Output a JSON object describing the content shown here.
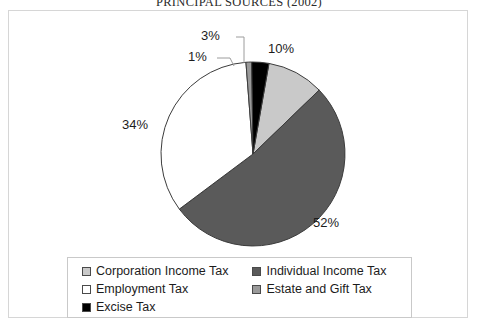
{
  "chart_data": {
    "type": "pie",
    "title": "PRINCIPAL SOURCES (2002)",
    "title_clipped": true,
    "xlabel": "",
    "ylabel": "",
    "legend_position": "bottom",
    "grid": false,
    "start_angle_deg": 10,
    "direction": "clockwise",
    "categories": [
      "Corporation Income Tax",
      "Individual Income Tax",
      "Employment Tax",
      "Estate and Gift Tax",
      "Excise Tax"
    ],
    "values": [
      10,
      52,
      34,
      1,
      3
    ],
    "data_labels": [
      "10%",
      "52%",
      "34%",
      "1%",
      "3%"
    ],
    "colors": [
      "#c9c9c9",
      "#5a5a5a",
      "#ffffff",
      "#9a9a9a",
      "#000000"
    ],
    "slice_outline_color": "#3c3c3c"
  },
  "title": {
    "text": "PRINCIPAL SOURCES (2002)"
  },
  "labels": {
    "corporation": "10%",
    "individual": "52%",
    "employment": "34%",
    "estate": "1%",
    "excise": "3%"
  },
  "legend": {
    "rows": [
      {
        "left": {
          "label": "Corporation Income Tax",
          "color": "#c9c9c9",
          "swatch": "legend-swatch-corporation"
        },
        "right": {
          "label": "Individual Income Tax",
          "color": "#5a5a5a",
          "swatch": "legend-swatch-individual"
        }
      },
      {
        "left": {
          "label": "Employment Tax",
          "color": "#ffffff",
          "swatch": "legend-swatch-employment"
        },
        "right": {
          "label": "Estate and Gift Tax",
          "color": "#9a9a9a",
          "swatch": "legend-swatch-estate"
        }
      },
      {
        "left": {
          "label": "Excise Tax",
          "color": "#000000",
          "swatch": "legend-swatch-excise"
        },
        "right": null
      }
    ]
  },
  "colors": {
    "frame_border": "#d6d6d6",
    "legend_border": "#c9c9c9",
    "text": "#1c1c1c",
    "background": "#ffffff"
  }
}
